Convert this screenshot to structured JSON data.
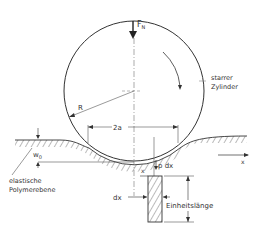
{
  "diagram": {
    "labels": {
      "force": "F",
      "force_sub": "N",
      "cylinder_line1": "starrer",
      "cylinder_line2": "Zylinder",
      "radius": "R",
      "contact_width": "2a",
      "depth": "w",
      "depth_sub": "0",
      "plane_line1": "elastische",
      "plane_line2": "Polymerebene",
      "x_axis": "x",
      "x_pos": "x",
      "pressure": "p dx",
      "dx": "dx",
      "unit_length": "Einheitslänge"
    },
    "colors": {
      "line": "#333333",
      "hatch": "#555555",
      "centerline": "#888888"
    }
  }
}
